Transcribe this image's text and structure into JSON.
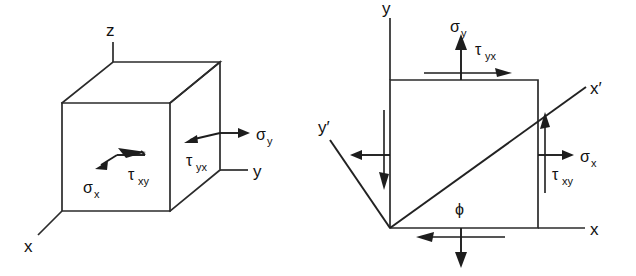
{
  "figure": {
    "background_color": "#ffffff",
    "ink_color": "#1d1d1d",
    "panels": [
      {
        "id": "left-panel",
        "name": "three-dimensional-stress-cube",
        "description": "Isometric cube showing stress components on a 3D element with x, y, z axes"
      },
      {
        "id": "right-panel",
        "name": "two-dimensional-stress-element",
        "description": "Plane stress square element with rotated x-prime y-prime axes at angle phi"
      }
    ]
  },
  "cube": {
    "axes": [
      {
        "name": "z-axis",
        "label": "z"
      },
      {
        "name": "y-axis",
        "label": "y"
      },
      {
        "name": "x-axis",
        "label": "x"
      }
    ],
    "stresses": [
      {
        "name": "sigma-x",
        "symbol": "σ",
        "subscript": "x",
        "face": "front",
        "direction": "arrow pointing left-down on front face"
      },
      {
        "name": "tau-xy",
        "symbol": "τ",
        "subscript": "xy",
        "face": "front",
        "direction": "bent arrow pointing left on front face"
      },
      {
        "name": "tau-yx",
        "symbol": "τ",
        "subscript": "yx",
        "face": "right",
        "direction": "arrow pointing left on right face"
      },
      {
        "name": "sigma-y",
        "symbol": "σ",
        "subscript": "y",
        "face": "right",
        "direction": "arrow pointing right, outward normal of right face"
      }
    ]
  },
  "element2d": {
    "axes": [
      {
        "name": "y-axis",
        "label": "y"
      },
      {
        "name": "x-axis",
        "label": "x"
      },
      {
        "name": "x-prime-axis",
        "label": "x′"
      },
      {
        "name": "y-prime-axis",
        "label": "y′"
      }
    ],
    "angle": {
      "name": "phi-angle",
      "label": "ϕ",
      "description": "angle between x axis and x-prime axis"
    },
    "stresses": [
      {
        "name": "sigma-y-top",
        "symbol": "σ",
        "subscript": "y",
        "edge": "top",
        "direction": "up"
      },
      {
        "name": "tau-yx-top",
        "symbol": "τ",
        "subscript": "yx",
        "edge": "top",
        "direction": "right"
      },
      {
        "name": "sigma-x-right",
        "symbol": "σ",
        "subscript": "x",
        "edge": "right",
        "direction": "right"
      },
      {
        "name": "tau-xy-right",
        "symbol": "τ",
        "subscript": "xy",
        "edge": "right",
        "direction": "up"
      },
      {
        "name": "sigma-x-left",
        "symbol": "σ",
        "subscript": "x",
        "edge": "left",
        "direction": "left"
      },
      {
        "name": "tau-xy-left",
        "symbol": "τ",
        "subscript": "xy",
        "edge": "left",
        "direction": "down"
      },
      {
        "name": "sigma-y-bottom",
        "symbol": "σ",
        "subscript": "y",
        "edge": "bottom",
        "direction": "down"
      },
      {
        "name": "tau-yx-bottom",
        "symbol": "τ",
        "subscript": "yx",
        "edge": "bottom",
        "direction": "left"
      }
    ]
  },
  "labels": {
    "cube_z": "z",
    "cube_y": "y",
    "cube_x": "x",
    "cube_sigma": "σ",
    "cube_sigma_x_sub": "x",
    "cube_sigma_y_sub": "y",
    "cube_tau": "τ",
    "cube_tau_xy_sub": "xy",
    "cube_tau_yx_sub": "yx",
    "el_y": "y",
    "el_x": "x",
    "el_x_prime": "x′",
    "el_y_prime": "y′",
    "el_phi": "ϕ",
    "el_sigma": "σ",
    "el_sigma_y_sub": "y",
    "el_sigma_x_sub": "x",
    "el_tau": "τ",
    "el_tau_yx_sub": "yx",
    "el_tau_xy_sub": "xy"
  }
}
